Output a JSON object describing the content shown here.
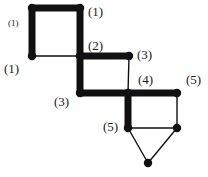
{
  "diagram": {
    "type": "graph",
    "colors": {
      "edge": "#111111",
      "node": "#111111",
      "background": "#ffffff",
      "label": "#1a1a1a"
    },
    "nodes": [
      {
        "id": "A",
        "x": 32,
        "y": 8
      },
      {
        "id": "B",
        "x": 80,
        "y": 8
      },
      {
        "id": "C",
        "x": 32,
        "y": 56
      },
      {
        "id": "D",
        "x": 80,
        "y": 56
      },
      {
        "id": "E",
        "x": 129,
        "y": 56
      },
      {
        "id": "F",
        "x": 80,
        "y": 93
      },
      {
        "id": "G",
        "x": 128,
        "y": 93
      },
      {
        "id": "H",
        "x": 177,
        "y": 93
      },
      {
        "id": "I",
        "x": 128,
        "y": 128
      },
      {
        "id": "J",
        "x": 177,
        "y": 128
      },
      {
        "id": "K",
        "x": 148,
        "y": 163
      }
    ],
    "edges": [
      {
        "from": "A",
        "to": "B",
        "weight": "thick"
      },
      {
        "from": "A",
        "to": "C",
        "weight": "thick"
      },
      {
        "from": "B",
        "to": "D",
        "weight": "thick"
      },
      {
        "from": "C",
        "to": "D",
        "weight": "thin"
      },
      {
        "from": "D",
        "to": "E",
        "weight": "thick"
      },
      {
        "from": "D",
        "to": "F",
        "weight": "thick"
      },
      {
        "from": "E",
        "to": "G",
        "weight": "thin"
      },
      {
        "from": "F",
        "to": "G",
        "weight": "thick"
      },
      {
        "from": "G",
        "to": "H",
        "weight": "thick"
      },
      {
        "from": "G",
        "to": "I",
        "weight": "thick"
      },
      {
        "from": "H",
        "to": "J",
        "weight": "thin"
      },
      {
        "from": "I",
        "to": "J",
        "weight": "thin"
      },
      {
        "from": "I",
        "to": "K",
        "weight": "thin"
      },
      {
        "from": "J",
        "to": "K",
        "weight": "thin"
      }
    ],
    "labels": [
      {
        "text": "(1)",
        "x": 88,
        "y": 16
      },
      {
        "text": "(1)",
        "x": 4,
        "y": 73
      },
      {
        "text": "(2)",
        "x": 88,
        "y": 50
      },
      {
        "text": "(3)",
        "x": 137,
        "y": 59
      },
      {
        "text": "(3)",
        "x": 54,
        "y": 106
      },
      {
        "text": "(4)",
        "x": 138,
        "y": 84
      },
      {
        "text": "(5)",
        "x": 186,
        "y": 84
      },
      {
        "text": "(5)",
        "x": 103,
        "y": 131
      }
    ],
    "small_label": {
      "text": "(1)",
      "x": 8,
      "y": 26
    }
  }
}
